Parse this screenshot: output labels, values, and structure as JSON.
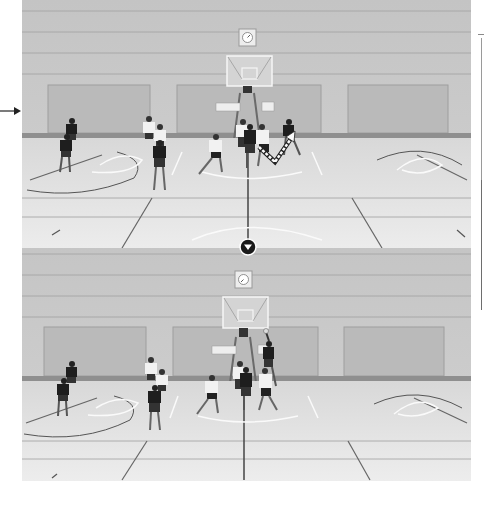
{
  "figure": {
    "colors": {
      "background": "#ffffff",
      "wall": "#c6c6c6",
      "wall_lines": "#a9a9a9",
      "panel": "#bdbdbd",
      "floor": "#e6e6e6",
      "court_lines_dark": "#5a5a5a",
      "court_lines_white": "#f8f8f8",
      "jersey_dark": "#1e1e1e",
      "jersey_light": "#f2f2f2",
      "indicator": "#1a1a1a"
    },
    "annotations": {
      "pointer_arrow": "arrow pointing right at the left edge of the top photo",
      "movement_arrow": "white zigzag arrow in the top photo showing player cut path",
      "sequence_indicator": "circular down-arrow between the two photos"
    },
    "photos": [
      {
        "id": "top",
        "label": ""
      },
      {
        "id": "bottom",
        "label": ""
      }
    ]
  }
}
